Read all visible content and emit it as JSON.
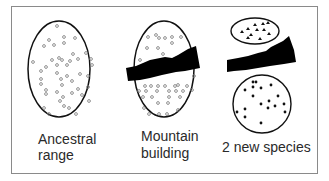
{
  "diagram": {
    "colors": {
      "frame": "#8a8a8a",
      "outline": "#111111",
      "barrier": "#000000",
      "open_dot": "#777777",
      "filled_dot": "#111111",
      "text": "#2a2a2a"
    },
    "panels": [
      {
        "id": "ancestral",
        "label_line1": "Ancestral",
        "label_line2": "range",
        "population": "single population of open-circle individuals",
        "marker": "open-circle"
      },
      {
        "id": "mountain",
        "label_line1": "Mountain",
        "label_line2": "building",
        "population": "population split by a black mountain barrier",
        "marker": "open-circle"
      },
      {
        "id": "new-species",
        "label_line1": "2 new species",
        "label_line2": "",
        "population": "two separated populations: triangles (top) and filled dots (bottom)",
        "markers": [
          "triangle",
          "filled-dot"
        ]
      }
    ]
  }
}
